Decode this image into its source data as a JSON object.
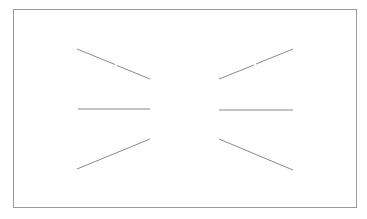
{
  "diagram": {
    "title": "",
    "frame": {
      "x": 13,
      "y": 9,
      "width": 344,
      "height": 199,
      "stroke": "#9a9a9a"
    },
    "line_color": "#8a8a8a",
    "line_width": 1,
    "segments": [
      {
        "id": "top-left-a",
        "x1": 77,
        "y1": 49,
        "x2": 115,
        "y2": 64.5
      },
      {
        "id": "top-left-b",
        "x1": 117,
        "y1": 65.5,
        "x2": 150,
        "y2": 79
      },
      {
        "id": "top-right-a",
        "x1": 219,
        "y1": 79,
        "x2": 254,
        "y2": 65
      },
      {
        "id": "top-right-b",
        "x1": 256,
        "y1": 64,
        "x2": 293,
        "y2": 49
      },
      {
        "id": "middle-left",
        "x1": 78,
        "y1": 109,
        "x2": 150,
        "y2": 109
      },
      {
        "id": "middle-right",
        "x1": 219,
        "y1": 110,
        "x2": 293,
        "y2": 110
      },
      {
        "id": "bottom-left",
        "x1": 77,
        "y1": 169,
        "x2": 150,
        "y2": 139
      },
      {
        "id": "bottom-right",
        "x1": 219,
        "y1": 139,
        "x2": 293,
        "y2": 170
      }
    ]
  }
}
